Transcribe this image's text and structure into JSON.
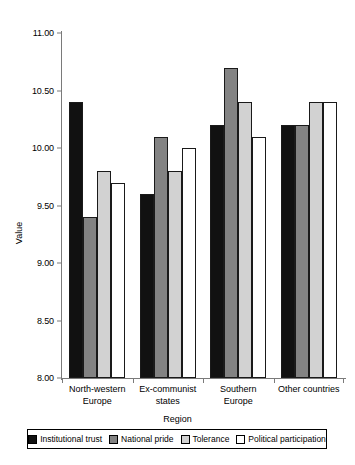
{
  "chart_data": {
    "type": "bar",
    "title": "",
    "xlabel": "Region",
    "ylabel": "Value",
    "ylim": [
      8.0,
      11.0
    ],
    "yticks": [
      "8.00",
      "8.50",
      "9.00",
      "9.50",
      "10.00",
      "10.50",
      "11.00"
    ],
    "ytick_values": [
      8.0,
      8.5,
      9.0,
      9.5,
      10.0,
      10.5,
      11.0
    ],
    "grid": false,
    "legend_position": "bottom",
    "categories": [
      "North-western Europe",
      "Ex-communist states",
      "Southern Europe",
      "Other countries"
    ],
    "category_lines": [
      [
        "North-western",
        "Europe"
      ],
      [
        "Ex-communist",
        "states"
      ],
      [
        "Southern",
        "Europe"
      ],
      [
        "Other countries",
        ""
      ]
    ],
    "series": [
      {
        "name": "Institutional trust",
        "color": "#111111",
        "values": [
          10.4,
          9.6,
          10.2,
          10.2
        ]
      },
      {
        "name": "National pride",
        "color": "#838383",
        "values": [
          9.4,
          10.1,
          10.7,
          10.2
        ]
      },
      {
        "name": "Tolerance",
        "color": "#d2d2d2",
        "values": [
          9.8,
          9.8,
          10.4,
          10.4
        ]
      },
      {
        "name": "Political participation",
        "color": "#ffffff",
        "values": [
          9.7,
          10.0,
          10.1,
          10.4
        ]
      }
    ]
  }
}
